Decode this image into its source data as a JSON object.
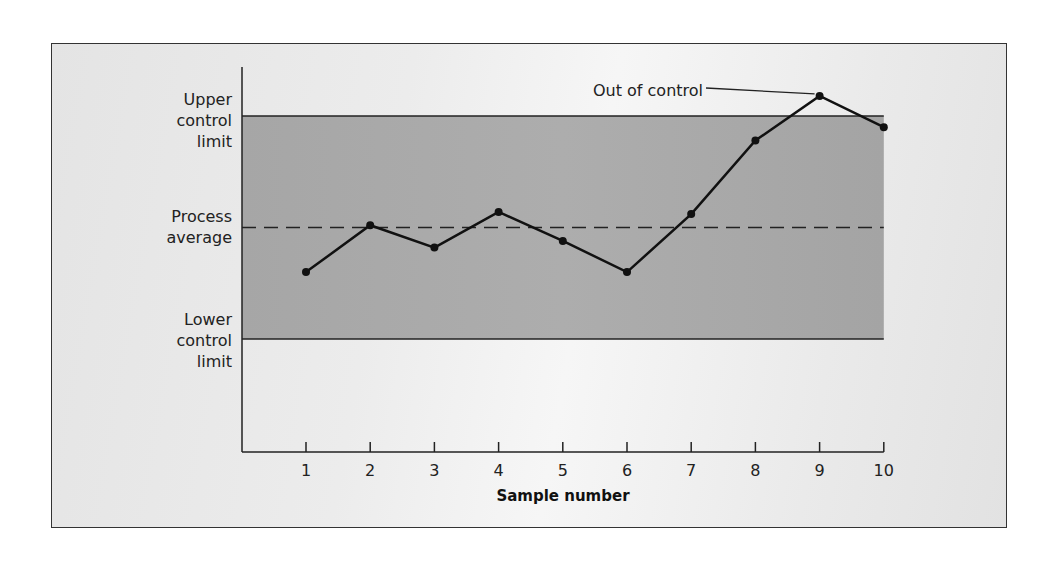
{
  "chart_data": {
    "type": "line",
    "title": "",
    "xlabel": "Sample number",
    "ylabel": "",
    "categories": [
      1,
      2,
      3,
      4,
      5,
      6,
      7,
      8,
      9,
      10
    ],
    "x_tick_labels": [
      "1",
      "2",
      "3",
      "4",
      "5",
      "6",
      "7",
      "8",
      "9",
      "10"
    ],
    "series": [
      {
        "name": "Sample measurement",
        "values": [
          0.3,
          0.51,
          0.41,
          0.57,
          0.44,
          0.3,
          0.56,
          0.89,
          1.09,
          0.95
        ]
      }
    ],
    "reference_lines": {
      "upper_control_limit": {
        "label": "Upper control limit",
        "value": 1.0,
        "style": "solid"
      },
      "process_average": {
        "label": "Process average",
        "value": 0.5,
        "style": "dashed"
      },
      "lower_control_limit": {
        "label": "Lower control limit",
        "value": 0.0,
        "style": "solid"
      }
    },
    "shaded_band": {
      "from": 0.0,
      "to": 1.0,
      "color": "#a9a9a9"
    },
    "annotations": [
      {
        "text": "Out of control",
        "points_to_category": 9
      }
    ],
    "y_tick_labels": [],
    "grid": false,
    "legend": "none"
  },
  "labels": {
    "ucl": [
      "Upper",
      "control",
      "limit"
    ],
    "avg": [
      "Process",
      "average"
    ],
    "lcl": [
      "Lower",
      "control",
      "limit"
    ],
    "annotation": "Out of control",
    "xtitle": "Sample number"
  },
  "colors": {
    "band": "#a9a9a9",
    "line": "#111111",
    "frame_bg": "#ebebeb"
  }
}
